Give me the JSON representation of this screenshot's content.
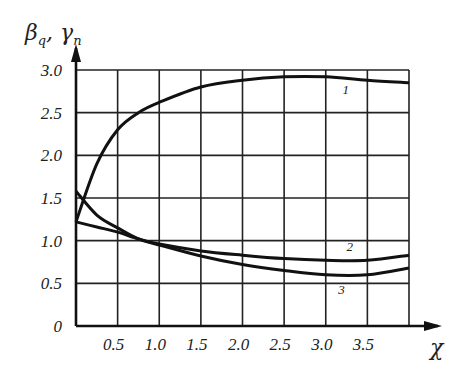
{
  "chart_data": {
    "type": "line",
    "title": "",
    "xlabel": "χ",
    "ylabel": "β_q , γ_n",
    "ylabel_parts": {
      "a": "β",
      "a_sub": "q",
      "sep": ",",
      "b": "γ",
      "b_sub": "n"
    },
    "xlim": [
      0,
      4.0
    ],
    "ylim": [
      0,
      3.0
    ],
    "grid": true,
    "x_ticks": [
      "0.5",
      "1.0",
      "1.5",
      "2.0",
      "2.5",
      "3.0",
      "3.5"
    ],
    "y_ticks": [
      "0",
      "0.5",
      "1.0",
      "1.5",
      "2.0",
      "2.5",
      "3.0"
    ],
    "x": [
      0,
      0.25,
      0.5,
      0.75,
      1.0,
      1.5,
      2.0,
      2.5,
      3.0,
      3.5,
      4.0
    ],
    "series": [
      {
        "name": "1",
        "values": [
          1.22,
          1.9,
          2.3,
          2.5,
          2.62,
          2.8,
          2.88,
          2.92,
          2.92,
          2.88,
          2.85
        ]
      },
      {
        "name": "2",
        "values": [
          1.22,
          1.16,
          1.1,
          1.02,
          0.96,
          0.88,
          0.83,
          0.79,
          0.77,
          0.77,
          0.83
        ]
      },
      {
        "name": "3",
        "values": [
          1.58,
          1.3,
          1.15,
          1.02,
          0.95,
          0.82,
          0.72,
          0.65,
          0.6,
          0.6,
          0.68
        ]
      }
    ],
    "annotations": [
      {
        "text": "1",
        "x": 3.2,
        "y": 2.72
      },
      {
        "text": "2",
        "x": 3.25,
        "y": 0.88
      },
      {
        "text": "3",
        "x": 3.15,
        "y": 0.38
      }
    ]
  }
}
